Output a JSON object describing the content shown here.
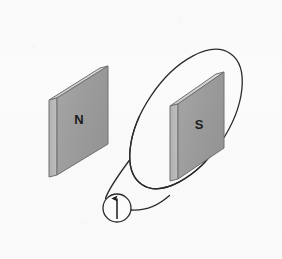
{
  "figure": {
    "background_color": "#fbfbfb",
    "width": 282,
    "height": 259
  },
  "magnets": [
    {
      "id": "north",
      "label": "N",
      "label_x": 72,
      "label_y": 119,
      "front_face_color": "#9d9d9d",
      "top_face_color": "#d2d2d2",
      "side_face_color": "#b9b9b9",
      "outline_color": "#6e6e6e",
      "front_face_points": "49,100 100,68 100,146 49,177",
      "top_face_points": "49,100 100,68 108,66 57,98",
      "side_face_points": "49,100 57,98 57,175 49,177",
      "x": 49,
      "y": 66,
      "width": 59,
      "height": 111
    },
    {
      "id": "south",
      "label": "S",
      "label_x": 191,
      "label_y": 124,
      "front_face_color": "#9d9d9d",
      "top_face_color": "#d2d2d2",
      "side_face_color": "#b9b9b9",
      "outline_color": "#6e6e6e",
      "front_face_points": "170,106 216,71 216,150 170,181",
      "top_face_points": "170,106 216,71 224,69 178,104",
      "side_face_points": "170,106 178,104 178,179 170,181",
      "x": 170,
      "y": 69,
      "width": 54,
      "height": 112
    }
  ],
  "loop": {
    "name": "conducting-wire-loop",
    "stroke_color": "#2a2a2a",
    "stroke_width": 1.3,
    "center_x": 186,
    "center_y": 119,
    "radius_x": 79,
    "radius_y": 42,
    "rotation_deg": -56,
    "description": "Single wire loop encircling the south-pole magnet"
  },
  "leads": [
    {
      "name": "left-lead-wire",
      "path": "M 128.5 161.0 C 118 176 110 188 107.0 199.5",
      "stroke_color": "#2a2a2a"
    },
    {
      "name": "right-lead-wire",
      "path": "M 131.5 209.5 C 146 210 158 205 168.5 196.5",
      "stroke_color": "#2a2a2a"
    }
  ],
  "meter": {
    "name": "current-meter",
    "center_x": 117,
    "center_y": 208,
    "radius": 14,
    "fill_color": "#fdfdfd",
    "stroke_color": "#2a2a2a",
    "needle": {
      "name": "current-direction-arrow",
      "direction": "up",
      "color": "#1b1b1b",
      "tail_x": 117,
      "tail_y": 218,
      "head_x": 117,
      "head_y": 197
    }
  }
}
